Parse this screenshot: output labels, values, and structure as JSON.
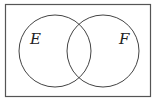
{
  "diagram": {
    "type": "venn",
    "universe": {
      "x": 5.5,
      "y": 4.5,
      "width": 145,
      "height": 92,
      "stroke": "#555555"
    },
    "sets": [
      {
        "name": "E",
        "label": "E",
        "cx": 55,
        "cy": 51,
        "r": 36,
        "label_x": 30,
        "label_y": 44
      },
      {
        "name": "F",
        "label": "F",
        "cx": 103,
        "cy": 51,
        "r": 36,
        "label_x": 119,
        "label_y": 44
      }
    ],
    "stroke_color": "#444444"
  }
}
